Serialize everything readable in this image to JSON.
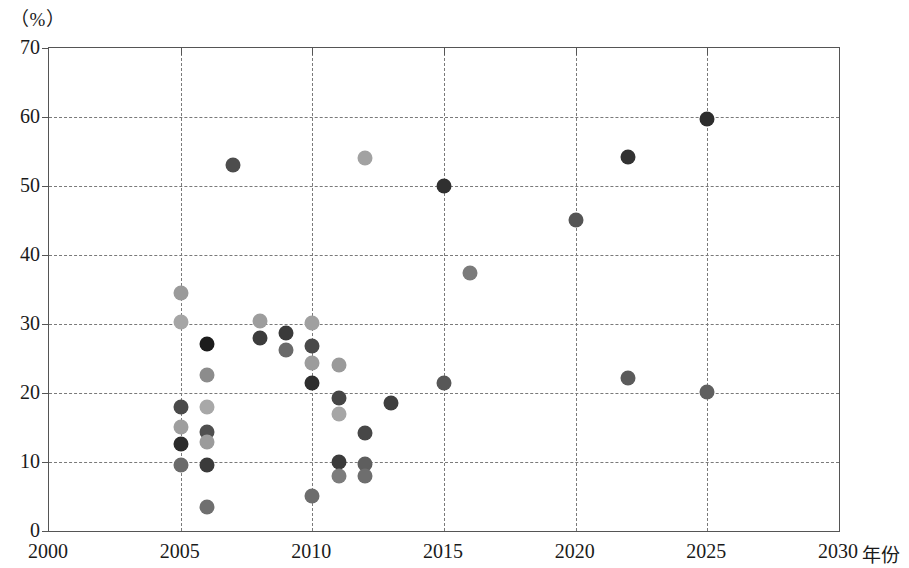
{
  "chart_data": {
    "type": "scatter",
    "title": "",
    "xlabel": "年份",
    "ylabel": "",
    "y_unit_label": "（%）",
    "xlim": [
      2000,
      2030
    ],
    "ylim": [
      0,
      70
    ],
    "xticks": [
      2000,
      2005,
      2010,
      2015,
      2020,
      2025,
      2030
    ],
    "yticks": [
      0,
      10,
      20,
      30,
      40,
      50,
      60,
      70
    ],
    "grid": true,
    "legend": "none",
    "points": [
      {
        "x": 2005,
        "y": 34.5,
        "color": "#9a9a9a"
      },
      {
        "x": 2005,
        "y": 30.3,
        "color": "#a5a5a5"
      },
      {
        "x": 2005,
        "y": 18.0,
        "color": "#4a4a4a"
      },
      {
        "x": 2005,
        "y": 15.1,
        "color": "#9e9e9e"
      },
      {
        "x": 2005,
        "y": 12.6,
        "color": "#2b2b2b"
      },
      {
        "x": 2005,
        "y": 9.6,
        "color": "#6b6b6b"
      },
      {
        "x": 2006,
        "y": 27.1,
        "color": "#1c1c1c"
      },
      {
        "x": 2006,
        "y": 22.6,
        "color": "#8c8c8c"
      },
      {
        "x": 2006,
        "y": 17.9,
        "color": "#a8a8a8"
      },
      {
        "x": 2006,
        "y": 14.4,
        "color": "#4f4f4f"
      },
      {
        "x": 2006,
        "y": 12.9,
        "color": "#9b9b9b"
      },
      {
        "x": 2006,
        "y": 9.6,
        "color": "#3a3a3a"
      },
      {
        "x": 2006,
        "y": 3.5,
        "color": "#6f6f6f"
      },
      {
        "x": 2007,
        "y": 53.0,
        "color": "#4d4d4d"
      },
      {
        "x": 2008,
        "y": 30.5,
        "color": "#9d9d9d"
      },
      {
        "x": 2008,
        "y": 28.0,
        "color": "#3c3c3c"
      },
      {
        "x": 2009,
        "y": 28.7,
        "color": "#3a3a3a"
      },
      {
        "x": 2009,
        "y": 26.2,
        "color": "#6a6a6a"
      },
      {
        "x": 2010,
        "y": 30.2,
        "color": "#a0a0a0"
      },
      {
        "x": 2010,
        "y": 26.8,
        "color": "#494949"
      },
      {
        "x": 2010,
        "y": 24.4,
        "color": "#9c9c9c"
      },
      {
        "x": 2010,
        "y": 21.5,
        "color": "#2e2e2e"
      },
      {
        "x": 2010,
        "y": 5.1,
        "color": "#6d6d6d"
      },
      {
        "x": 2011,
        "y": 24.1,
        "color": "#9a9a9a"
      },
      {
        "x": 2011,
        "y": 19.3,
        "color": "#454545"
      },
      {
        "x": 2011,
        "y": 17.0,
        "color": "#a6a6a6"
      },
      {
        "x": 2011,
        "y": 10.0,
        "color": "#3b3b3b"
      },
      {
        "x": 2011,
        "y": 7.9,
        "color": "#7c7c7c"
      },
      {
        "x": 2012,
        "y": 54.1,
        "color": "#a2a2a2"
      },
      {
        "x": 2012,
        "y": 14.2,
        "color": "#474747"
      },
      {
        "x": 2012,
        "y": 9.7,
        "color": "#5e5e5e"
      },
      {
        "x": 2012,
        "y": 7.9,
        "color": "#6e6e6e"
      },
      {
        "x": 2013,
        "y": 18.5,
        "color": "#3f3f3f"
      },
      {
        "x": 2015,
        "y": 50.0,
        "color": "#303030"
      },
      {
        "x": 2015,
        "y": 21.5,
        "color": "#575757"
      },
      {
        "x": 2016,
        "y": 37.4,
        "color": "#7b7b7b"
      },
      {
        "x": 2020,
        "y": 45.1,
        "color": "#555555"
      },
      {
        "x": 2022,
        "y": 54.2,
        "color": "#323232"
      },
      {
        "x": 2022,
        "y": 22.2,
        "color": "#5b5b5b"
      },
      {
        "x": 2025,
        "y": 59.7,
        "color": "#2d2d2d"
      },
      {
        "x": 2025,
        "y": 20.1,
        "color": "#5f5f5f"
      }
    ]
  }
}
